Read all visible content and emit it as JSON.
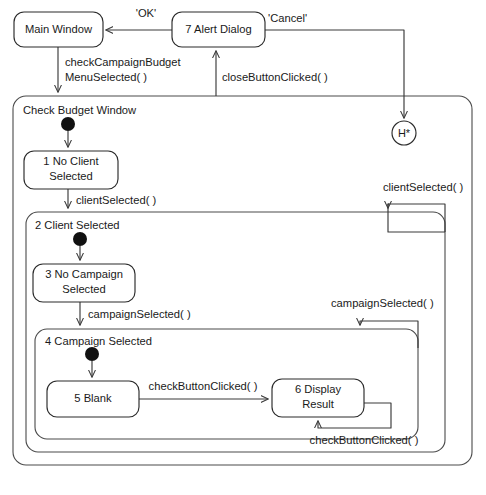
{
  "diagram": {
    "kind": "uml-state-machine-diagram",
    "states": [
      {
        "id": "main-window",
        "label": "Main Window",
        "type": "simple",
        "x": 14,
        "y": 12,
        "w": 89,
        "h": 35
      },
      {
        "id": "alert-dialog",
        "label": "7 Alert Dialog",
        "type": "simple",
        "x": 172,
        "y": 12,
        "w": 93,
        "h": 35
      },
      {
        "id": "check-budget",
        "label": "Check Budget Window",
        "type": "composite",
        "x": 13,
        "y": 96,
        "w": 459,
        "h": 369
      },
      {
        "id": "no-client",
        "label": "1 No Client\nSelected",
        "type": "simple",
        "x": 24,
        "y": 151,
        "w": 94,
        "h": 38
      },
      {
        "id": "client-selected",
        "label": "2 Client Selected",
        "type": "composite",
        "x": 26,
        "y": 212,
        "w": 419,
        "h": 240
      },
      {
        "id": "no-campaign",
        "label": "3 No Campaign\nSelected",
        "type": "simple",
        "x": 33,
        "y": 264,
        "w": 102,
        "h": 38
      },
      {
        "id": "campaign-selected",
        "label": "4 Campaign Selected",
        "type": "composite",
        "x": 35,
        "y": 329,
        "w": 383,
        "h": 110
      },
      {
        "id": "blank",
        "label": "5 Blank",
        "type": "simple",
        "x": 47,
        "y": 381,
        "w": 92,
        "h": 36
      },
      {
        "id": "display-result",
        "label": "6 Display\nResult",
        "type": "simple",
        "x": 272,
        "y": 379,
        "w": 92,
        "h": 38
      }
    ],
    "pseudostates": [
      {
        "id": "initial-check-budget",
        "type": "initial",
        "cx": 68,
        "cy": 124
      },
      {
        "id": "initial-client-selected",
        "type": "initial",
        "cx": 80,
        "cy": 239
      },
      {
        "id": "initial-campaign-selected",
        "type": "initial",
        "cx": 92,
        "cy": 354
      },
      {
        "id": "history-deep",
        "type": "deep-history",
        "label": "H*",
        "cx": 404,
        "cy": 133,
        "r": 12
      }
    ],
    "transitions": [
      {
        "id": "t-ok",
        "label": "'OK'",
        "from": "alert-dialog",
        "to": "main-window"
      },
      {
        "id": "t-cancel",
        "label": "'Cancel'",
        "from": "alert-dialog",
        "to": "history-deep"
      },
      {
        "id": "t-check-campaign-budget",
        "label": "checkCampaignBudget\nMenuSelected( )",
        "from": "main-window",
        "to": "check-budget"
      },
      {
        "id": "t-close-button",
        "label": "closeButtonClicked( )",
        "from": "check-budget",
        "to": "alert-dialog"
      },
      {
        "id": "t-client-selected",
        "label": "clientSelected( )",
        "from": "no-client",
        "to": "client-selected"
      },
      {
        "id": "t-client-selected-loop",
        "label": "clientSelected( )",
        "from": "check-budget",
        "to": "client-selected"
      },
      {
        "id": "t-campaign-selected",
        "label": "campaignSelected( )",
        "from": "no-campaign",
        "to": "campaign-selected"
      },
      {
        "id": "t-campaign-selected-loop",
        "label": "campaignSelected( )",
        "from": "client-selected",
        "to": "campaign-selected"
      },
      {
        "id": "t-check-button",
        "label": "checkButtonClicked( )",
        "from": "blank",
        "to": "display-result"
      },
      {
        "id": "t-check-button-self",
        "label": "checkButtonClicked( )",
        "from": "display-result",
        "to": "display-result"
      }
    ],
    "labels": {
      "main_window": "Main Window",
      "alert_dialog": "7 Alert Dialog",
      "check_budget_window": "Check Budget Window",
      "no_client_line1": "1 No Client",
      "no_client_line2": "Selected",
      "client_selected": "2 Client Selected",
      "no_campaign_line1": "3 No Campaign",
      "no_campaign_line2": "Selected",
      "campaign_selected": "4 Campaign Selected",
      "blank": "5 Blank",
      "display_result_line1": "6 Display",
      "display_result_line2": "Result",
      "history": "H*",
      "ok": "'OK'",
      "cancel": "'Cancel'",
      "check_campaign_budget_line1": "checkCampaignBudget",
      "check_campaign_budget_line2": "MenuSelected( )",
      "close_button_clicked": "closeButtonClicked( )",
      "client_selected_event": "clientSelected( )",
      "client_selected_event_2": "clientSelected( )",
      "campaign_selected_event": "campaignSelected( )",
      "campaign_selected_event_2": "campaignSelected( )",
      "check_button_clicked": "checkButtonClicked( )",
      "check_button_clicked_2": "checkButtonClicked( )"
    },
    "colors": {
      "background": "#ffffff",
      "stroke": "#2b2b2b",
      "composite_stroke": "#4a4a4a",
      "text": "#1a1a1a",
      "initial_fill": "#111111"
    }
  }
}
